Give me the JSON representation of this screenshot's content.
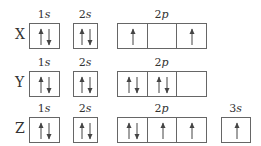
{
  "diagram": {
    "type": "orbital-box-diagram",
    "rows": [
      {
        "element": "X",
        "orbitals": [
          {
            "label_num": "1",
            "label_sub": "s",
            "cells": [
              [
                "up",
                "down"
              ]
            ]
          },
          {
            "label_num": "2",
            "label_sub": "s",
            "cells": [
              [
                "up",
                "down"
              ]
            ]
          },
          {
            "label_num": "2",
            "label_sub": "p",
            "cells": [
              [
                "up"
              ],
              [],
              [
                "up"
              ]
            ]
          }
        ]
      },
      {
        "element": "Y",
        "orbitals": [
          {
            "label_num": "1",
            "label_sub": "s",
            "cells": [
              [
                "up",
                "down"
              ]
            ]
          },
          {
            "label_num": "2",
            "label_sub": "s",
            "cells": [
              [
                "up",
                "down"
              ]
            ]
          },
          {
            "label_num": "2",
            "label_sub": "p",
            "cells": [
              [
                "up",
                "down"
              ],
              [
                "up",
                "down"
              ],
              []
            ]
          }
        ]
      },
      {
        "element": "Z",
        "orbitals": [
          {
            "label_num": "1",
            "label_sub": "s",
            "cells": [
              [
                "up",
                "down"
              ]
            ]
          },
          {
            "label_num": "2",
            "label_sub": "s",
            "cells": [
              [
                "up",
                "down"
              ]
            ]
          },
          {
            "label_num": "2",
            "label_sub": "p",
            "cells": [
              [
                "up",
                "down"
              ],
              [
                "up"
              ],
              [
                "up"
              ]
            ]
          },
          {
            "label_num": "3",
            "label_sub": "s",
            "cells": [
              [
                "up"
              ]
            ]
          }
        ]
      }
    ]
  }
}
